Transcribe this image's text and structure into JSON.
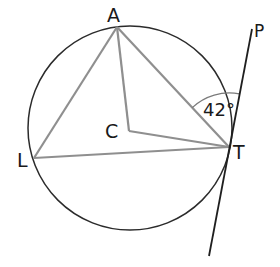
{
  "diagram": {
    "type": "circle-tangent-geometry",
    "circle": {
      "center_label": "C",
      "cx": 130,
      "cy": 128,
      "r": 102
    },
    "points": {
      "A": {
        "label": "A",
        "x": 117,
        "y": 27
      },
      "L": {
        "label": "L",
        "x": 34,
        "y": 158
      },
      "T": {
        "label": "T",
        "x": 229,
        "y": 147
      },
      "C": {
        "label": "C",
        "x": 129,
        "y": 131
      },
      "P": {
        "label": "P",
        "x": 252,
        "y": 29
      }
    },
    "tangent_line": {
      "through": "T",
      "toward": "P",
      "x1": 252,
      "y1": 29,
      "x2": 209,
      "y2": 256
    },
    "segments": [
      "AL",
      "AT",
      "LT",
      "AC",
      "CT"
    ],
    "angle": {
      "vertex": "T",
      "between": [
        "TA",
        "TP"
      ],
      "label": "42°"
    },
    "colors": {
      "circle": "#2b2b2b",
      "chords": "#8f8f8f",
      "tangent": "#1f1f1f",
      "text": "#1a1a1a"
    }
  }
}
